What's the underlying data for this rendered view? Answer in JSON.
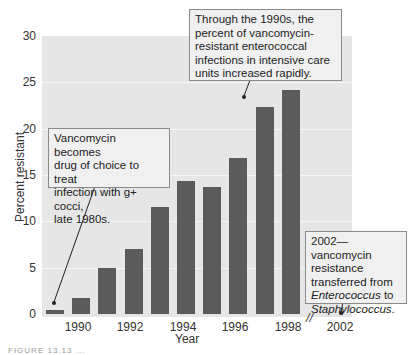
{
  "chart_data": {
    "type": "bar",
    "title": "",
    "xlabel": "Year",
    "ylabel": "Percent resistant",
    "ylim": [
      0,
      30
    ],
    "yticks": [
      0,
      5,
      10,
      15,
      20,
      25,
      30
    ],
    "xtick_labels": [
      "1990",
      "1992",
      "1994",
      "1996",
      "1998",
      "2002"
    ],
    "grid": true,
    "legend": null,
    "categories": [
      "1989",
      "1990",
      "1991",
      "1992",
      "1993",
      "1994",
      "1995",
      "1996",
      "1997",
      "1998"
    ],
    "values": [
      0.4,
      1.7,
      5.0,
      7.0,
      11.5,
      14.4,
      13.7,
      16.8,
      22.3,
      24.2
    ],
    "annotations": [
      "Vancomycin becomes drug of choice to treat infection with g+ cocci, late 1980s.",
      "Through the 1990s, the percent of vancomycin-resistant enterococcal infections in intensive care units increased rapidly.",
      "2002—vancomycin resistance transferred from Enterococcus to Staphylococcus."
    ],
    "axis_break": "//"
  },
  "axis": {
    "y_ticks": [
      "30",
      "25",
      "20",
      "15",
      "10",
      "5",
      "0"
    ],
    "x_ticks": [
      "1990",
      "1992",
      "1994",
      "1996",
      "1998",
      "2002"
    ],
    "x_label": "Year",
    "y_label": "Percent resistant",
    "break_mark": "//"
  },
  "callouts": {
    "left": [
      "Vancomycin becomes",
      "drug of choice to treat",
      "infection with g+ cocci,",
      "late 1980s."
    ],
    "top": [
      "Through the 1990s, the",
      "percent of vancomycin-",
      "resistant enterococcal",
      "infections in intensive care",
      "units increased rapidly."
    ],
    "right": {
      "line1": "2002—vancomycin",
      "line2": "resistance",
      "line3": "transferred from",
      "line4_italic": "Enterococcus",
      "line4_rest": " to",
      "line5_italic": "Staphylococcus",
      "line5_rest": "."
    }
  },
  "caption": "FIGURE 13.13 ..."
}
